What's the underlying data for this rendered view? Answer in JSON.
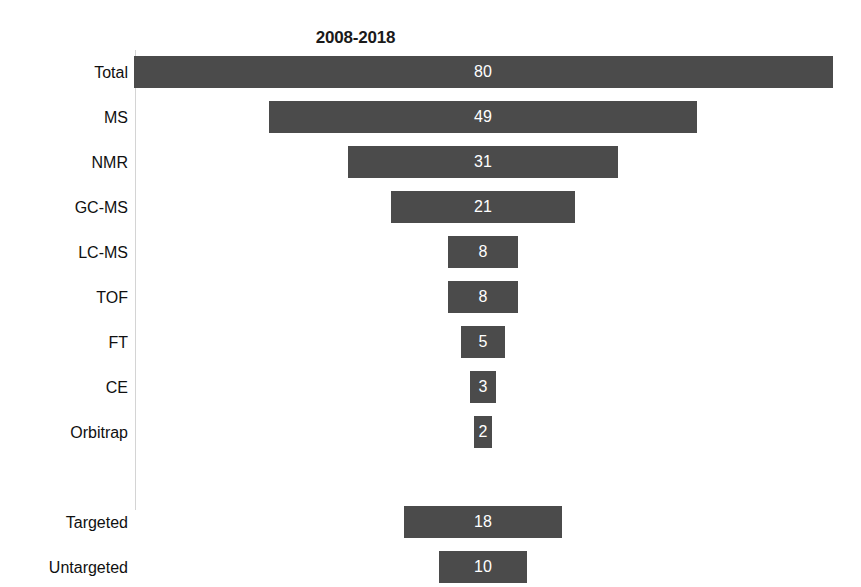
{
  "chart_data": {
    "type": "bar",
    "subtype": "funnel",
    "title": "2008-2018",
    "xlabel": "",
    "ylabel": "",
    "orientation": "horizontal",
    "grid": false,
    "legend": false,
    "axis_line_visible": true,
    "bar_color": "#4b4b4b",
    "value_label_color": "#ffffff",
    "categories": [
      "Total",
      "MS",
      "NMR",
      "GC-MS",
      "LC-MS",
      "TOF",
      "FT",
      "CE",
      "Orbitrap",
      "",
      "Targeted",
      "Untargeted"
    ],
    "values": [
      80,
      49,
      31,
      21,
      8,
      8,
      5,
      3,
      2,
      null,
      18,
      10
    ],
    "xlim": [
      0,
      80
    ],
    "series": [
      {
        "name": "2008-2018",
        "values": [
          80,
          49,
          31,
          21,
          8,
          8,
          5,
          3,
          2,
          null,
          18,
          10
        ]
      }
    ],
    "rows": [
      {
        "label": "Total",
        "value": 80,
        "value_text": "80",
        "spacer": false
      },
      {
        "label": "MS",
        "value": 49,
        "value_text": "49",
        "spacer": false
      },
      {
        "label": "NMR",
        "value": 31,
        "value_text": "31",
        "spacer": false
      },
      {
        "label": "GC-MS",
        "value": 21,
        "value_text": "21",
        "spacer": false
      },
      {
        "label": "LC-MS",
        "value": 8,
        "value_text": "8",
        "spacer": false
      },
      {
        "label": "TOF",
        "value": 8,
        "value_text": "8",
        "spacer": false
      },
      {
        "label": "FT",
        "value": 5,
        "value_text": "5",
        "spacer": false
      },
      {
        "label": "CE",
        "value": 3,
        "value_text": "3",
        "spacer": false
      },
      {
        "label": "Orbitrap",
        "value": 2,
        "value_text": "2",
        "spacer": false
      },
      {
        "label": "",
        "value": null,
        "value_text": "",
        "spacer": true
      },
      {
        "label": "Targeted",
        "value": 18,
        "value_text": "18",
        "spacer": false
      },
      {
        "label": "Untargeted",
        "value": 10,
        "value_text": "10",
        "spacer": false
      }
    ]
  }
}
